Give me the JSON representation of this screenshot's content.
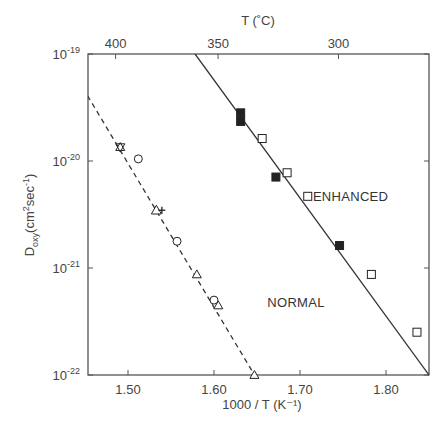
{
  "chart_data": {
    "type": "scatter",
    "title": "",
    "xlabel": "1000 / T (K⁻¹)",
    "ylabel": "D_oxy (cm²sec⁻¹)",
    "top_axis_label": "T (˚C)",
    "xlim": [
      1.453,
      1.85
    ],
    "ylim_log10": [
      -22,
      -19
    ],
    "yscale": "log",
    "x_ticks": [
      1.5,
      1.6,
      1.7,
      1.8
    ],
    "x_tick_labels": [
      "1.50",
      "1.60",
      "1.70",
      "1.80"
    ],
    "y_ticks_log10": [
      -19,
      -20,
      -21,
      -22
    ],
    "y_tick_labels": [
      {
        "base": "10",
        "exp": "-19"
      },
      {
        "base": "10",
        "exp": "-20"
      },
      {
        "base": "10",
        "exp": "-21"
      },
      {
        "base": "10",
        "exp": "-22"
      }
    ],
    "top_ticks_celsius": [
      400,
      350,
      300
    ],
    "top_tick_labels": [
      "400",
      "350",
      "300"
    ],
    "grid": false,
    "legend": "none (inline labels)",
    "series": [
      {
        "name": "NORMAL",
        "label_pos": {
          "x": 1.662,
          "log10y": -21.36
        },
        "fit_line": {
          "style": "dashed",
          "x": [
            1.453,
            1.647
          ],
          "log10y": [
            -19.39,
            -22.0
          ]
        },
        "points": [
          {
            "x": 1.491,
            "log10y": -19.87,
            "marker": "triangle-star"
          },
          {
            "x": 1.512,
            "log10y": -19.98,
            "marker": "circle-open"
          },
          {
            "x": 1.533,
            "log10y": -20.46,
            "marker": "triangle-cross"
          },
          {
            "x": 1.557,
            "log10y": -20.75,
            "marker": "circle-open"
          },
          {
            "x": 1.58,
            "log10y": -21.06,
            "marker": "triangle-open"
          },
          {
            "x": 1.6,
            "log10y": -21.3,
            "marker": "circle-open"
          },
          {
            "x": 1.605,
            "log10y": -21.35,
            "marker": "triangle-open"
          },
          {
            "x": 1.647,
            "log10y": -22.0,
            "marker": "triangle-open"
          }
        ]
      },
      {
        "name": "ENHANCED",
        "label_pos": {
          "x": 1.715,
          "log10y": -20.37
        },
        "fit_line": {
          "style": "solid",
          "x": [
            1.578,
            1.85
          ],
          "log10y": [
            -19.0,
            -22.0
          ]
        },
        "points": [
          {
            "x": 1.631,
            "log10y": -19.55,
            "marker": "square-filled"
          },
          {
            "x": 1.631,
            "log10y": -19.63,
            "marker": "square-filled"
          },
          {
            "x": 1.672,
            "log10y": -20.15,
            "marker": "square-filled"
          },
          {
            "x": 1.746,
            "log10y": -20.79,
            "marker": "square-filled"
          },
          {
            "x": 1.656,
            "log10y": -19.79,
            "marker": "square-open"
          },
          {
            "x": 1.685,
            "log10y": -20.11,
            "marker": "square-open"
          },
          {
            "x": 1.709,
            "log10y": -20.33,
            "marker": "square-open"
          },
          {
            "x": 1.783,
            "log10y": -21.06,
            "marker": "square-open"
          },
          {
            "x": 1.836,
            "log10y": -21.6,
            "marker": "square-open"
          }
        ]
      }
    ]
  },
  "colors": {
    "axis": "#555555",
    "line": "#333333",
    "marker": "#222222",
    "background": "#ffffff"
  }
}
